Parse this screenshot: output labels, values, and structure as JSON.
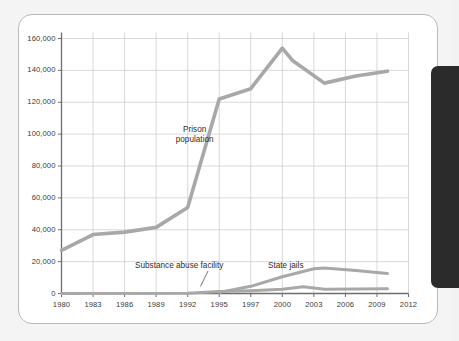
{
  "figure": {
    "card_label": "chart-card",
    "side_panel_label": "dark-side-panel"
  },
  "chart_data": {
    "type": "line",
    "title": "",
    "subtitle": "",
    "xlabel": "",
    "ylabel": "",
    "grid": true,
    "legend_position": "inline-annotations",
    "xlim": [
      1980,
      2012
    ],
    "ylim": [
      0,
      160000
    ],
    "ytick_labels": [
      "0",
      "20,000",
      "40,000",
      "60,000",
      "80,000",
      "100,000",
      "120,000",
      "140,000",
      "160,000"
    ],
    "ytick_values": [
      0,
      20000,
      40000,
      60000,
      80000,
      100000,
      120000,
      140000,
      160000
    ],
    "xtick_labels": [
      "1980",
      "1983",
      "1986",
      "1989",
      "1992",
      "1995",
      "1997",
      "2000",
      "2003",
      "2006",
      "2009",
      "2012"
    ],
    "xtick_values": [
      1980,
      1983,
      1986,
      1989,
      1992,
      1995,
      1997,
      2000,
      2003,
      2006,
      2009,
      2012
    ],
    "series": [
      {
        "name": "Prison population",
        "color": "#a8a8a8",
        "x": [
          1980,
          1983,
          1986,
          1989,
          1992,
          1995,
          1997,
          2000,
          2001,
          2004,
          2007,
          2010
        ],
        "values": [
          27000,
          37000,
          38500,
          41500,
          54000,
          122000,
          128500,
          154000,
          146000,
          132000,
          136500,
          139500
        ]
      },
      {
        "name": "State jails",
        "color": "#a8a8a8",
        "x": [
          1995,
          1997,
          2000,
          2003,
          2004,
          2007,
          2010
        ],
        "values": [
          700,
          4500,
          10500,
          15500,
          16000,
          14500,
          12500
        ]
      },
      {
        "name": "Substance abuse facility",
        "color": "#a8a8a8",
        "x": [
          1980,
          1992,
          1995,
          1997,
          2000,
          2002,
          2004,
          2007,
          2010
        ],
        "values": [
          0,
          200,
          1200,
          1800,
          2600,
          4200,
          2600,
          2800,
          3000
        ]
      }
    ],
    "annotations": [
      {
        "text_line1": "Prison",
        "text_line2": "population",
        "name": "prison-population-label"
      },
      {
        "text": "Substance abuse facility",
        "name": "substance-abuse-facility-label",
        "has_leader_line": true
      },
      {
        "text": "State jails",
        "name": "state-jails-label"
      }
    ],
    "colors": {
      "line": "#a8a8a8",
      "grid": "#c9c9c9",
      "axis": "#6d6d6d",
      "text": "#3a3a3a",
      "card_bg": "#ffffff",
      "page_bg": "#f4f4f4",
      "panel": "#2b2b2b"
    }
  }
}
